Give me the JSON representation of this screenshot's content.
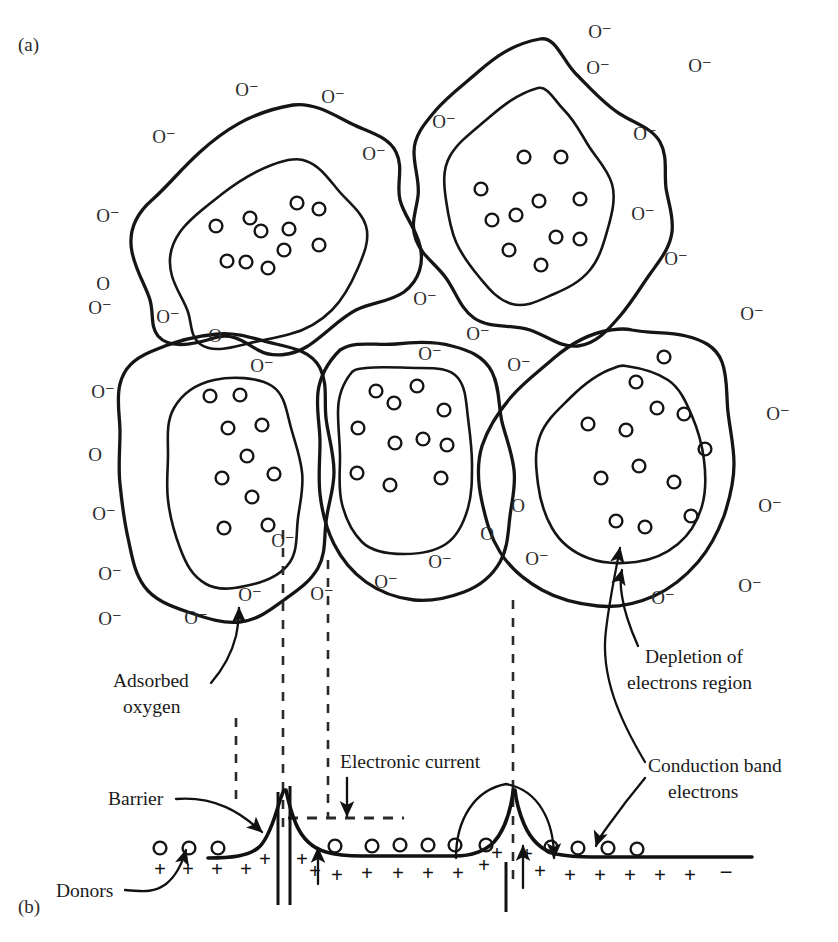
{
  "figure": {
    "panel_a_label": "(a)",
    "panel_b_label": "(b)"
  },
  "symbols": {
    "oxygen_ion": "O⁻",
    "oxygen_neutral": "O",
    "plus": "+",
    "minus": "−"
  },
  "annotations": {
    "adsorbed_oxygen_line1": "Adsorbed",
    "adsorbed_oxygen_line2": "oxygen",
    "barrier": "Barrier",
    "donors": "Donors",
    "electronic_current": "Electronic current",
    "depletion_line1": "Depletion of",
    "depletion_line2": "electrons region",
    "conduction_line1": "Conduction band",
    "conduction_line2": "electrons"
  },
  "panel_a": {
    "grains": [
      {
        "name": "grain-top-left",
        "electron_count": 9
      },
      {
        "name": "grain-top-right",
        "electron_count": 11
      },
      {
        "name": "grain-mid-left",
        "electron_count": 10
      },
      {
        "name": "grain-mid-center",
        "electron_count": 11
      },
      {
        "name": "grain-mid-right",
        "electron_count": 13
      }
    ],
    "surface_oxygen_labels": [
      {
        "text": "O⁻",
        "x": 247,
        "y": 96
      },
      {
        "text": "O⁻",
        "x": 333,
        "y": 103
      },
      {
        "text": "O⁻",
        "x": 164,
        "y": 143
      },
      {
        "text": "O⁻",
        "x": 374,
        "y": 160
      },
      {
        "text": "O⁻",
        "x": 108,
        "y": 222
      },
      {
        "text": "O",
        "x": 103,
        "y": 290
      },
      {
        "text": "O⁻",
        "x": 100,
        "y": 314
      },
      {
        "text": "O⁻",
        "x": 168,
        "y": 323
      },
      {
        "text": "O",
        "x": 215,
        "y": 342
      },
      {
        "text": "O⁻",
        "x": 103,
        "y": 398
      },
      {
        "text": "O",
        "x": 95,
        "y": 461
      },
      {
        "text": "O⁻",
        "x": 104,
        "y": 520
      },
      {
        "text": "O⁻",
        "x": 110,
        "y": 580
      },
      {
        "text": "O⁻",
        "x": 110,
        "y": 625
      },
      {
        "text": "O⁻",
        "x": 196,
        "y": 624
      },
      {
        "text": "O⁻",
        "x": 250,
        "y": 601
      },
      {
        "text": "O⁻",
        "x": 283,
        "y": 547
      },
      {
        "text": "O⁻",
        "x": 322,
        "y": 600
      },
      {
        "text": "O⁻",
        "x": 386,
        "y": 588
      },
      {
        "text": "O⁻",
        "x": 262,
        "y": 372
      },
      {
        "text": "O⁻",
        "x": 444,
        "y": 128
      },
      {
        "text": "O⁻",
        "x": 598,
        "y": 74
      },
      {
        "text": "O⁻",
        "x": 700,
        "y": 72
      },
      {
        "text": "O⁻",
        "x": 645,
        "y": 140
      },
      {
        "text": "O⁻",
        "x": 643,
        "y": 220
      },
      {
        "text": "O⁻",
        "x": 676,
        "y": 265
      },
      {
        "text": "O⁻",
        "x": 752,
        "y": 320
      },
      {
        "text": "O⁻",
        "x": 778,
        "y": 420
      },
      {
        "text": "O⁻",
        "x": 770,
        "y": 512
      },
      {
        "text": "O⁻",
        "x": 750,
        "y": 592
      },
      {
        "text": "O⁻",
        "x": 663,
        "y": 604
      },
      {
        "text": "O⁻",
        "x": 537,
        "y": 565
      },
      {
        "text": "O",
        "x": 518,
        "y": 512
      },
      {
        "text": "O",
        "x": 487,
        "y": 540
      },
      {
        "text": "O⁻",
        "x": 440,
        "y": 568
      },
      {
        "text": "O⁻",
        "x": 519,
        "y": 371
      },
      {
        "text": "O⁻",
        "x": 425,
        "y": 305
      },
      {
        "text": "O⁻",
        "x": 478,
        "y": 340
      },
      {
        "text": "O⁻",
        "x": 430,
        "y": 360
      },
      {
        "text": "O⁻",
        "x": 600,
        "y": 38
      }
    ]
  },
  "panel_b": {
    "dashed_verticals": [
      {
        "name": "boundary-guide-1",
        "x": 283,
        "y1": 530,
        "y2": 828
      },
      {
        "name": "boundary-guide-2",
        "x": 328,
        "y1": 560,
        "y2": 818
      },
      {
        "name": "boundary-guide-3",
        "x": 513,
        "y1": 600,
        "y2": 880
      },
      {
        "name": "depletion-width-left",
        "x": 236,
        "y1": 718,
        "y2": 800
      }
    ],
    "barriers": [
      {
        "name": "barrier-left",
        "peak_x": 283
      },
      {
        "name": "barrier-right",
        "peak_x": 513
      }
    ],
    "donor_plus_count": 18,
    "electron_circle_count": 14,
    "terminal_minus": "−"
  }
}
